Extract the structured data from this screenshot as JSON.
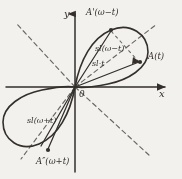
{
  "figure": {
    "kind": "polar-curve-diagram",
    "background_color": "#f2f1ee",
    "ink_color": "#35312d",
    "dashed_color": "#6b6762"
  },
  "axes": {
    "x_label": "x",
    "y_label": "y",
    "origin_label": "0",
    "x_axis_name": "horizontal-axis",
    "y_axis_name": "vertical-axis"
  },
  "points": [
    {
      "id": "A-prime",
      "label": "A'(ω−t)",
      "x": 111,
      "y": 30,
      "label_x": 86,
      "label_y": 9
    },
    {
      "id": "A",
      "label": "A(t)",
      "x": 140,
      "y": 62,
      "label_x": 148,
      "label_y": 53
    },
    {
      "id": "A-double",
      "label": "A″(ω+t)",
      "x": 48,
      "y": 150,
      "label_x": 37,
      "label_y": 157
    }
  ],
  "vector_labels": [
    {
      "id": "sl-omega-minus-t",
      "label": "sl(ω−t)",
      "x": 95,
      "y": 46
    },
    {
      "id": "sl-t",
      "label": "sl·t",
      "x": 92,
      "y": 61
    },
    {
      "id": "sl-omega-plus-t",
      "label": "sl(ω+t)",
      "x": 28,
      "y": 118
    }
  ],
  "curve": {
    "petal_upper_right": "two-lobe closed loop through origin in first quadrant",
    "petal_lower_left": "mirrored lobe in third quadrant"
  },
  "dashed_lines": [
    {
      "id": "diagonal-up-left",
      "from": [
        75,
        87
      ],
      "to": [
        16,
        23
      ]
    },
    {
      "id": "diagonal-down-right",
      "from": [
        75,
        87
      ],
      "to": [
        150,
        155
      ]
    },
    {
      "id": "diagonal-up-right",
      "from": [
        75,
        87
      ],
      "to": [
        156,
        25
      ]
    },
    {
      "id": "diagonal-down-left",
      "from": [
        75,
        87
      ],
      "to": [
        22,
        158
      ]
    },
    {
      "id": "chord-a-prime-to-a",
      "from": [
        111,
        30
      ],
      "to": [
        140,
        62
      ]
    }
  ]
}
